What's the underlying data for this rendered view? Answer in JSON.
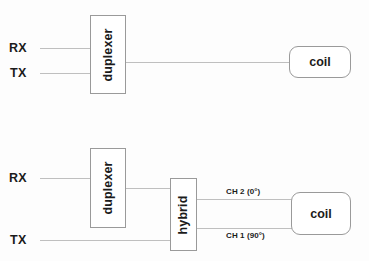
{
  "figure": {
    "background_color": "#fdfdfd",
    "line_color": "#bfbfbf",
    "box_border_color": "#9a9a9a",
    "text_color": "#1b1b1b"
  },
  "diagram_top": {
    "ports": {
      "rx": "RX",
      "tx": "TX"
    },
    "duplexer": "duplexer",
    "coil": "coil"
  },
  "diagram_bottom": {
    "ports": {
      "rx": "RX",
      "tx": "TX"
    },
    "duplexer": "duplexer",
    "hybrid": "hybrid",
    "coil": "coil",
    "channels": {
      "ch2": "CH 2 (0°)",
      "ch1": "CH 1 (90°)"
    }
  }
}
